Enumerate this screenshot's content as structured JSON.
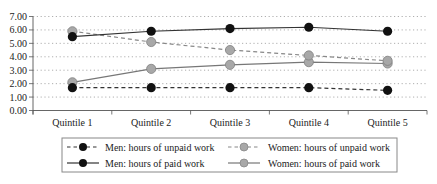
{
  "chart_data": {
    "type": "line",
    "title": "",
    "xlabel": "",
    "ylabel": "",
    "categories": [
      "Quintile 1",
      "Quintile 2",
      "Quintile 3",
      "Quintile 4",
      "Quintile 5"
    ],
    "ylim": [
      0,
      7
    ],
    "yticks": [
      "0.00",
      "1.00",
      "2.00",
      "3.00",
      "4.00",
      "5.00",
      "6.00",
      "7.00"
    ],
    "grid": "horizontal dotted",
    "legend_position": "bottom",
    "series": [
      {
        "name": "Men: hours of unpaid work",
        "values": [
          1.7,
          1.7,
          1.7,
          1.7,
          1.5
        ],
        "line": "dashed",
        "line_color": "#333333",
        "marker_color": "#111111"
      },
      {
        "name": "Women: hours of unpaid work",
        "values": [
          5.9,
          5.1,
          4.5,
          4.1,
          3.7
        ],
        "line": "dashed",
        "line_color": "#888888",
        "marker_color": "#a8a8a8"
      },
      {
        "name": "Men: hours of paid work",
        "values": [
          5.5,
          5.9,
          6.1,
          6.2,
          5.9
        ],
        "line": "solid",
        "line_color": "#333333",
        "marker_color": "#111111"
      },
      {
        "name": "Women: hours of paid work",
        "values": [
          2.1,
          3.1,
          3.4,
          3.6,
          3.5
        ],
        "line": "solid",
        "line_color": "#777777",
        "marker_color": "#a8a8a8"
      }
    ]
  },
  "legend": {
    "items": [
      "Men: hours of unpaid work",
      "Women: hours of unpaid work",
      "Men: hours of paid work",
      "Women: hours of paid work"
    ]
  }
}
